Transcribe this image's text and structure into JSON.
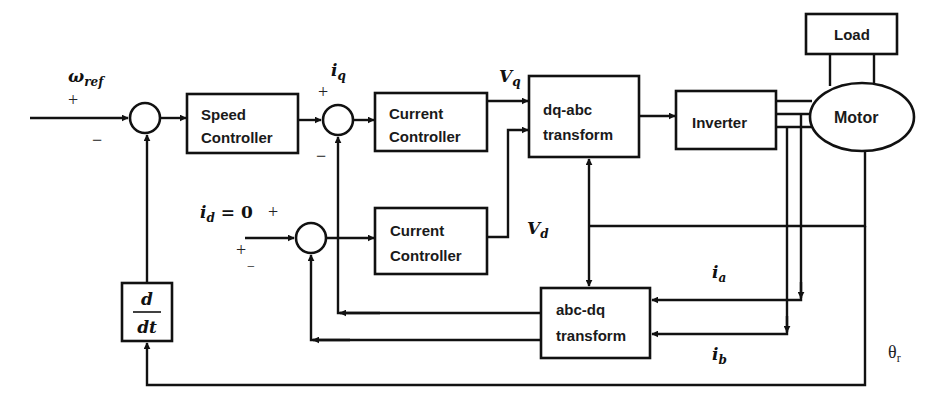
{
  "diagram": {
    "type": "control block diagram (vector-controlled motor drive)",
    "blocks": {
      "speed_controller": {
        "line1": "Speed",
        "line2": "Controller"
      },
      "current_controller_q": {
        "line1": "Current",
        "line2": "Controller"
      },
      "current_controller_d": {
        "line1": "Current",
        "line2": "Controller"
      },
      "dq_abc": {
        "line1": "dq-abc",
        "line2": "transform"
      },
      "inverter": {
        "label": "Inverter"
      },
      "motor": {
        "label": "Motor"
      },
      "load": {
        "label": "Load"
      },
      "abc_dq": {
        "line1": "abc-dq",
        "line2": "transform"
      },
      "derivative": {
        "num": "d",
        "den": "dt"
      }
    },
    "signals": {
      "omega_ref": {
        "main": "ω",
        "sub": "ref"
      },
      "iq": {
        "main": "i",
        "sub": "q"
      },
      "id": {
        "main": "i",
        "sub": "d",
        "rest": " = 0"
      },
      "vq": {
        "main": "V",
        "sub": "q"
      },
      "vd": {
        "main": "V",
        "sub": "d"
      },
      "ia": {
        "main": "i",
        "sub": "a"
      },
      "ib": {
        "main": "i",
        "sub": "b"
      },
      "theta_r": {
        "main": "θ",
        "sub": "r"
      }
    },
    "signs": {
      "speed_plus": "+",
      "speed_minus": "−",
      "iq_plus": "+",
      "iq_minus": "−",
      "id_plus_top": "+",
      "id_plus_left": "+",
      "id_minus": "−"
    }
  }
}
